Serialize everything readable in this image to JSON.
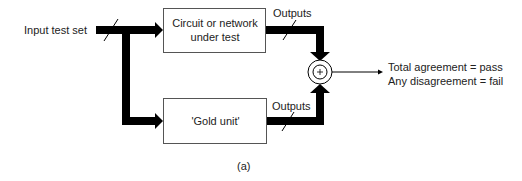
{
  "diagram": {
    "input_label": "Input test set",
    "top_box": {
      "line1": "Circuit or network",
      "line2": "under test"
    },
    "bottom_box": {
      "label": "'Gold unit'"
    },
    "top_output_label": "Outputs",
    "bottom_output_label": "Outputs",
    "comparator_symbol": "+",
    "result": {
      "line1": "Total agreement = pass",
      "line2": "Any disagreement = fail"
    },
    "caption": "(a)",
    "colors": {
      "line": "#000000",
      "box_border": "#555555",
      "text": "#222222"
    }
  }
}
